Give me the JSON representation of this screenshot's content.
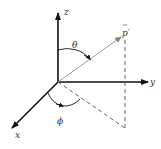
{
  "diagram": {
    "type": "spherical-coordinates",
    "axes": {
      "z": {
        "label": "z"
      },
      "y": {
        "label": "y"
      },
      "x": {
        "label": "x"
      }
    },
    "vector": {
      "label": "p′",
      "arrow_symbol": "→"
    },
    "angles": {
      "polar": {
        "label": "θ"
      },
      "azimuthal": {
        "label": "ϕ"
      }
    },
    "colors": {
      "axis": "#111111",
      "vector": "#999999",
      "dashed": "#555555",
      "label": "#333333"
    }
  }
}
